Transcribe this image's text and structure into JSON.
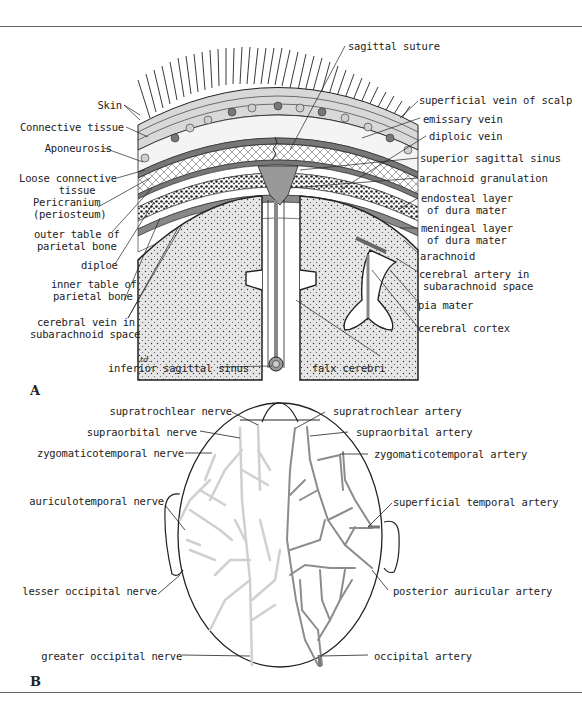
{
  "figure": {
    "panel_a": {
      "letter": "A",
      "signature": "td.",
      "labels_left": {
        "skin": "Skin",
        "connective_tissue": "Connective tissue",
        "aponeurosis": "Aponeurosis",
        "loose_connective_1": "Loose connective",
        "loose_connective_2": "tissue",
        "pericranium_1": "Pericranium",
        "pericranium_2": "(periosteum)",
        "outer_table_1": "outer table of",
        "outer_table_2": "parietal bone",
        "diploe": "diploe",
        "inner_table_1": "inner table of",
        "inner_table_2": "parietal bone",
        "cerebral_vein_1": "cerebral vein in",
        "cerebral_vein_2": "subarachnoid space"
      },
      "labels_right": {
        "sagittal_suture": "sagittal suture",
        "superficial_vein": "superficial vein of scalp",
        "emissary_vein": "emissary vein",
        "diploic_vein": "diploic vein",
        "superior_sagittal_sinus": "superior sagittal sinus",
        "arachnoid_granulation": "arachnoid granulation",
        "endosteal_1": "endosteal layer",
        "endosteal_2": "of dura mater",
        "meningeal_1": "meningeal layer",
        "meningeal_2": "of dura mater",
        "arachnoid": "arachnoid",
        "cerebral_artery_1": "cerebral artery in",
        "cerebral_artery_2": "subarachnoid space",
        "pia_mater": "pia mater",
        "cerebral_cortex": "cerebral cortex"
      },
      "labels_bottom": {
        "inferior_sagittal_sinus": "inferior sagittal sinus",
        "falx_cerebri": "falx cerebri"
      }
    },
    "panel_b": {
      "letter": "B",
      "nerves": [
        "supratrochlear nerve",
        "supraorbital nerve",
        "zygomaticotemporal nerve",
        "auriculotemporal nerve",
        "lesser occipital nerve",
        "greater occipital nerve"
      ],
      "arteries": [
        "supratrochlear artery",
        "supraorbital artery",
        "zygomaticotemporal artery",
        "superficial temporal artery",
        "posterior auricular artery",
        "occipital artery"
      ]
    },
    "colors": {
      "line": "#222222",
      "gray_fill": "#9a9a9a",
      "light_fill": "#e2e2e2",
      "nerve": "#d2d2d2",
      "artery": "#8a8a8a",
      "rule": "#666666"
    }
  }
}
